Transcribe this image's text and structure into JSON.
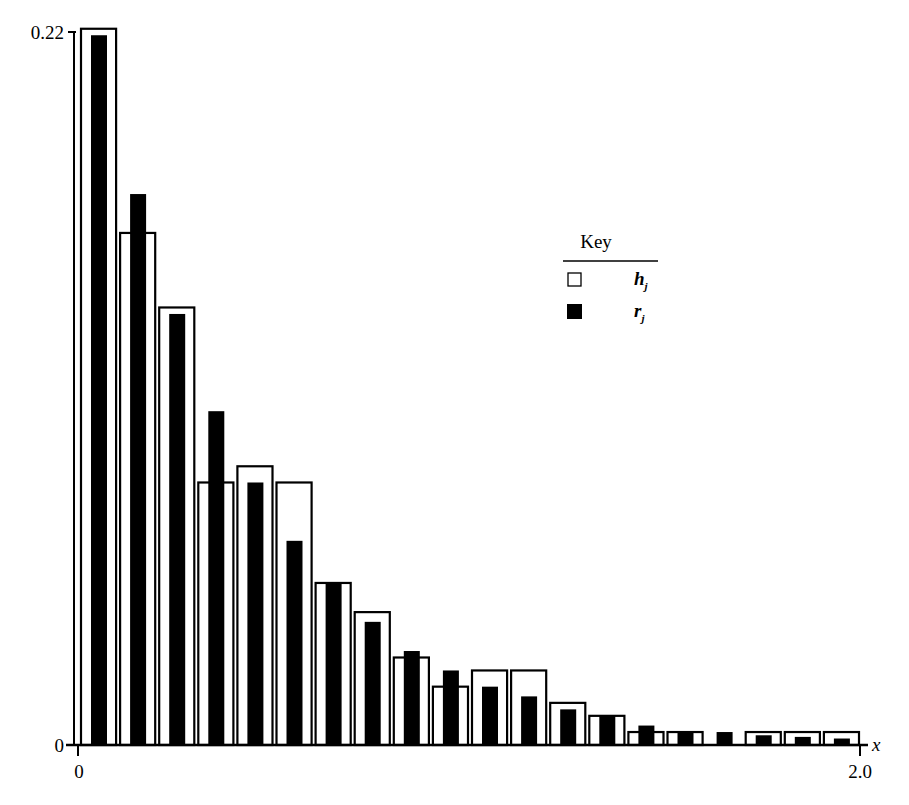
{
  "chart_data": {
    "type": "bar",
    "title": "",
    "xlabel": "x",
    "ylabel": "",
    "xlim": [
      0,
      2.0
    ],
    "ylim": [
      0,
      0.22
    ],
    "x_tick_labels": [
      "0",
      "2.0"
    ],
    "y_tick_labels": [
      "0",
      "0.22"
    ],
    "grid": false,
    "legend_position": "upper right (inside)",
    "legend": {
      "title": "Key",
      "entries": [
        {
          "symbol": "open-square",
          "label": "h",
          "subscript": "j"
        },
        {
          "symbol": "filled-square",
          "label": "r",
          "subscript": "j"
        }
      ]
    },
    "bin_width": 0.1,
    "categories": [
      "0.0-0.1",
      "0.1-0.2",
      "0.2-0.3",
      "0.3-0.4",
      "0.4-0.5",
      "0.5-0.6",
      "0.6-0.7",
      "0.7-0.8",
      "0.8-0.9",
      "0.9-1.0",
      "1.0-1.1",
      "1.1-1.2",
      "1.2-1.3",
      "1.3-1.4",
      "1.4-1.5",
      "1.5-1.6",
      "1.6-1.7",
      "1.7-1.8",
      "1.8-1.9",
      "1.9-2.0"
    ],
    "series": [
      {
        "name": "h_j",
        "style": "open",
        "values": [
          0.221,
          0.158,
          0.135,
          0.081,
          0.086,
          0.081,
          0.05,
          0.041,
          0.027,
          0.018,
          0.023,
          0.023,
          0.013,
          0.009,
          0.004,
          0.004,
          0.0,
          0.004,
          0.004,
          0.004
        ]
      },
      {
        "name": "r_j",
        "style": "filled",
        "values": [
          0.219,
          0.17,
          0.133,
          0.103,
          0.081,
          0.063,
          0.05,
          0.038,
          0.029,
          0.023,
          0.018,
          0.015,
          0.011,
          0.009,
          0.006,
          0.004,
          0.004,
          0.003,
          0.0025,
          0.002
        ]
      }
    ]
  },
  "colors": {
    "open_bar_stroke": "#000000",
    "open_bar_fill": "#ffffff",
    "filled_bar": "#000000",
    "axis": "#000000",
    "background": "#ffffff"
  }
}
